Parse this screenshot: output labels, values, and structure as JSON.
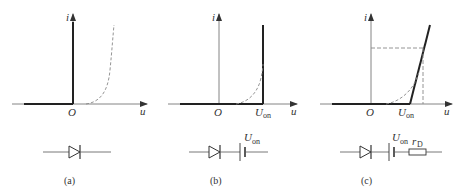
{
  "figure": {
    "panels": [
      {
        "id": "a",
        "caption": "(a)",
        "y_axis_label": "i",
        "x_axis_label": "u",
        "origin_label": "O",
        "description": "Ideal diode characteristic: vertical line on i-axis, horizontal along negative u-axis; dashed actual exponential curve for reference",
        "circuit": [
          "diode"
        ]
      },
      {
        "id": "b",
        "caption": "(b)",
        "y_axis_label": "i",
        "x_axis_label": "u",
        "origin_label": "O",
        "threshold_label": "U",
        "threshold_sub": "on",
        "description": "Constant voltage drop model: vertical line at U_on; dashed actual curve",
        "circuit": [
          "diode",
          "battery"
        ],
        "circuit_label": "U",
        "circuit_label_sub": "on"
      },
      {
        "id": "c",
        "caption": "(c)",
        "y_axis_label": "i",
        "x_axis_label": "u",
        "origin_label": "O",
        "threshold_label": "U",
        "threshold_sub": "on",
        "description": "Piecewise-linear model: sloped line starting at U_on; dashed operating-point guides; dashed actual curve",
        "circuit": [
          "diode",
          "battery",
          "resistor"
        ],
        "circuit_label": "U",
        "circuit_label_sub": "on",
        "resistor_label": "r",
        "resistor_sub": "D"
      }
    ],
    "colors": {
      "line": "#333333",
      "thin_line": "#555555",
      "dashed": "#888888"
    }
  }
}
